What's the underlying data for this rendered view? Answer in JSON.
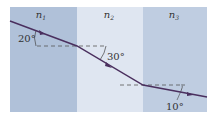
{
  "media": {
    "n1": {
      "label": "n",
      "sub": "1",
      "color": "#b0c1d9"
    },
    "n2": {
      "label": "n",
      "sub": "2",
      "color": "#dfe6f1"
    },
    "n3": {
      "label": "n",
      "sub": "3",
      "color": "#bfcde1"
    }
  },
  "angles": {
    "a1": "20°",
    "a2": "30°",
    "a3": "10°"
  },
  "colors": {
    "ray": "#4a2f5e",
    "dash": "#555555"
  }
}
